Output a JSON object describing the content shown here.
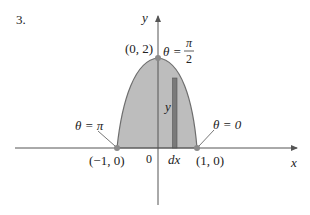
{
  "problem_number": "3.",
  "axes": {
    "x_label": "x",
    "y_label": "y",
    "origin_label": "0"
  },
  "points": {
    "top": {
      "label": "(0, 2)",
      "theta_label": "θ = ",
      "theta_num": "π",
      "theta_den": "2"
    },
    "left": {
      "label": "(−1, 0)",
      "theta_label": "θ = π"
    },
    "right": {
      "label": "(1, 0)",
      "theta_label": "θ = 0"
    }
  },
  "strip": {
    "height_label": "y",
    "width_label": "dx"
  },
  "colors": {
    "region_fill": "#b9b9b9",
    "curve_stroke": "#6e6e6e",
    "strip_fill": "#7a7a7a",
    "axis": "#555555",
    "point": "#8a8a8a"
  }
}
